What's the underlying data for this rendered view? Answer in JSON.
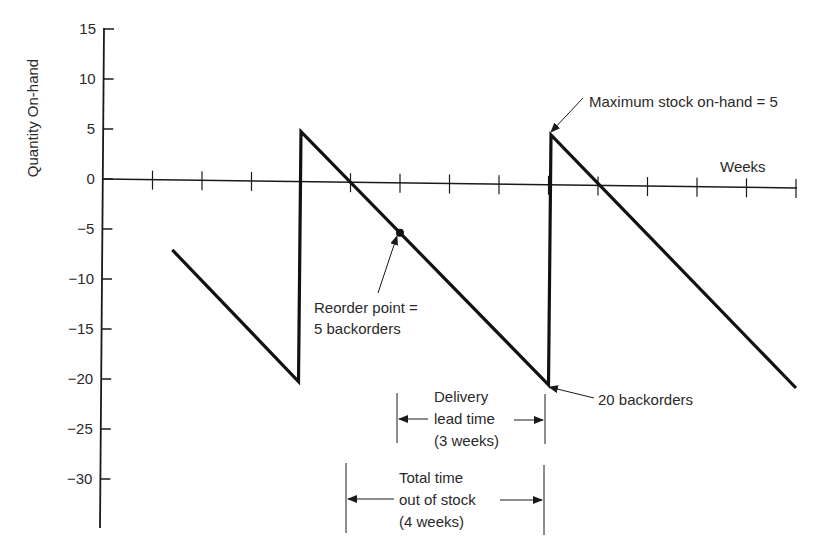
{
  "chart_data": {
    "type": "line",
    "title": "",
    "xlabel": "Weeks",
    "ylabel": "Quantity On-hand",
    "xlim": [
      0,
      14
    ],
    "ylim": [
      -35,
      15
    ],
    "grid": false,
    "legend": null,
    "y_ticks": [
      15,
      10,
      5,
      0,
      -5,
      -10,
      -15,
      -20,
      -25,
      -30
    ],
    "y_tick_labels": [
      "15",
      "10",
      "5",
      "0",
      "−5",
      "−10",
      "−15",
      "−20",
      "−25",
      "−30"
    ],
    "x_ticks": [
      1,
      2,
      3,
      4,
      5,
      6,
      7,
      8,
      9,
      10,
      11,
      12,
      13,
      14
    ],
    "series": [
      {
        "name": "Quantity on-hand (sawtooth)",
        "points": [
          {
            "x": 1.4,
            "y": -7
          },
          {
            "x": 3.95,
            "y": -20
          },
          {
            "x": 4.0,
            "y": 5
          },
          {
            "x": 9.0,
            "y": -20
          },
          {
            "x": 9.05,
            "y": 5
          },
          {
            "x": 14.0,
            "y": -20
          }
        ]
      }
    ],
    "markers": [
      {
        "name": "reorder-point",
        "x": 6,
        "y": -5
      }
    ],
    "annotations": {
      "max_stock": "Maximum stock on-hand = 5",
      "reorder_line1": "Reorder point =",
      "reorder_line2": "5 backorders",
      "backorders": "20 backorders",
      "lead_line1": "Delivery",
      "lead_line2": "lead time",
      "lead_line3": "(3 weeks)",
      "total_line1": "Total time",
      "total_line2": "out of stock",
      "total_line3": "(4 weeks)"
    },
    "dimensions": {
      "delivery_lead_time_weeks": 3,
      "delivery_lead_time_span": [
        6,
        9
      ],
      "total_time_out_of_stock_weeks": 4,
      "total_time_out_of_stock_span": [
        5,
        9
      ],
      "maximum_stock": 5,
      "reorder_point_backorders": 5,
      "max_backorders": 20
    }
  }
}
